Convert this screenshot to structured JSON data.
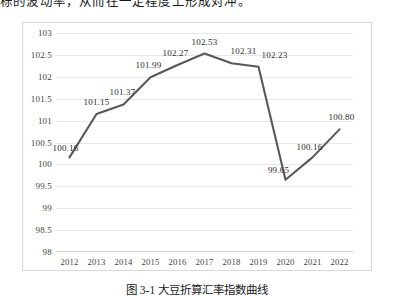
{
  "page": {
    "top_text": "标的波动率，从而在一定程度上形成对冲。",
    "caption": "图 3-1  大豆折算汇率指数曲线"
  },
  "colors": {
    "line": "#595959",
    "gridline": "#e8e8e8",
    "border": "#d9d9d9",
    "axis_text": "#3f3f3f",
    "label_text": "#2b2b2b",
    "background": "#ffffff"
  },
  "chart_data": {
    "type": "line",
    "title": "",
    "xlabel": "",
    "ylabel": "",
    "categories": [
      "2012",
      "2013",
      "2014",
      "2015",
      "2016",
      "2017",
      "2018",
      "2019",
      "2020",
      "2021",
      "2022"
    ],
    "values": [
      100.16,
      101.15,
      101.37,
      101.99,
      102.27,
      102.53,
      102.31,
      102.23,
      99.65,
      100.16,
      100.8
    ],
    "point_labels": [
      "100.16",
      "101.15",
      "101.37",
      "101.99",
      "102.27",
      "102.53",
      "102.31",
      "102.23",
      "99.65",
      "100.16",
      "100.80"
    ],
    "ylim": [
      98,
      103
    ],
    "yticks": [
      103,
      102.5,
      102,
      101.5,
      101,
      100.5,
      100,
      99.5,
      99,
      98.5,
      98
    ],
    "ytick_labels": [
      "103",
      "102.5",
      "102",
      "101.5",
      "101",
      "100.5",
      "100",
      "99.5",
      "99",
      "98.5",
      "98"
    ],
    "grid": true,
    "legend": false,
    "markers": false,
    "series": [
      {
        "name": "指数",
        "values": [
          100.16,
          101.15,
          101.37,
          101.99,
          102.27,
          102.53,
          102.31,
          102.23,
          99.65,
          100.16,
          100.8
        ]
      }
    ]
  }
}
